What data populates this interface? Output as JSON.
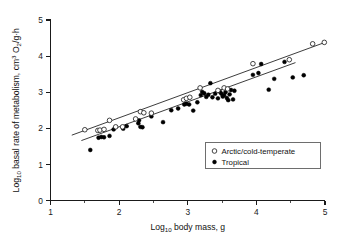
{
  "chart_data": {
    "type": "scatter",
    "title": "",
    "subtitle": "",
    "xlabel": "Log10 body mass, g",
    "ylabel": "Log10 basal rate of metabolism, cm3 O2/g·h",
    "xlabel_parts": {
      "prefix": "Log",
      "subscript": "10",
      "suffix": " body mass, g"
    },
    "ylabel_parts": {
      "prefix": "Log",
      "subscript": "10",
      "mid": " basal rate of metabolism, cm",
      "superscript": "3",
      "mid2": " O",
      "subscript2": "2",
      "suffix": "/g·h"
    },
    "xlim": [
      1,
      5
    ],
    "ylim": [
      0,
      5
    ],
    "xticks": [
      1,
      2,
      3,
      4,
      5
    ],
    "xtick_labels": [
      "1",
      "2",
      "3",
      "4",
      "5"
    ],
    "x_minor_ticks": [
      1.5,
      2.5,
      3.5,
      4.5
    ],
    "yticks": [
      0,
      1,
      2,
      3,
      4,
      5
    ],
    "ytick_labels": [
      "0",
      "1",
      "2",
      "3",
      "4",
      "5"
    ],
    "grid": false,
    "legend_position": "lower-right",
    "series": [
      {
        "name": "Arctic/cold-temperate",
        "marker": "open-circle",
        "color": "#000000",
        "points": [
          [
            1.5,
            1.96
          ],
          [
            1.69,
            1.94
          ],
          [
            1.72,
            1.95
          ],
          [
            1.78,
            1.97
          ],
          [
            1.86,
            2.22
          ],
          [
            1.95,
            2.04
          ],
          [
            2.05,
            2.04
          ],
          [
            2.24,
            2.26
          ],
          [
            2.31,
            2.46
          ],
          [
            2.36,
            2.43
          ],
          [
            2.47,
            2.42
          ],
          [
            2.94,
            2.79
          ],
          [
            2.98,
            2.83
          ],
          [
            3.03,
            2.86
          ],
          [
            3.18,
            3.12
          ],
          [
            3.44,
            3.05
          ],
          [
            3.53,
            3.12
          ],
          [
            3.58,
            3.09
          ],
          [
            3.95,
            3.79
          ],
          [
            4.48,
            3.9
          ],
          [
            4.82,
            4.34
          ],
          [
            4.99,
            4.38
          ]
        ]
      },
      {
        "name": "Tropical",
        "marker": "filled-circle",
        "color": "#000000",
        "points": [
          [
            1.58,
            1.4
          ],
          [
            1.7,
            1.74
          ],
          [
            1.74,
            1.76
          ],
          [
            1.78,
            1.75
          ],
          [
            1.86,
            1.79
          ],
          [
            1.92,
            1.97
          ],
          [
            2.06,
            1.99
          ],
          [
            2.11,
            2.06
          ],
          [
            2.28,
            2.14
          ],
          [
            2.29,
            2.22
          ],
          [
            2.31,
            2.04
          ],
          [
            2.34,
            2.03
          ],
          [
            2.47,
            2.33
          ],
          [
            2.64,
            2.17
          ],
          [
            2.76,
            2.5
          ],
          [
            2.86,
            2.55
          ],
          [
            2.95,
            2.66
          ],
          [
            2.98,
            2.68
          ],
          [
            3.02,
            2.66
          ],
          [
            3.08,
            2.49
          ],
          [
            3.14,
            2.72
          ],
          [
            3.19,
            2.92
          ],
          [
            3.21,
            3.01
          ],
          [
            3.24,
            2.97
          ],
          [
            3.27,
            2.87
          ],
          [
            3.3,
            2.93
          ],
          [
            3.33,
            3.25
          ],
          [
            3.36,
            2.86
          ],
          [
            3.4,
            2.96
          ],
          [
            3.44,
            2.83
          ],
          [
            3.47,
            3.01
          ],
          [
            3.49,
            2.96
          ],
          [
            3.51,
            2.88
          ],
          [
            3.53,
            2.92
          ],
          [
            3.55,
            3.0
          ],
          [
            3.57,
            2.84
          ],
          [
            3.59,
            2.78
          ],
          [
            3.61,
            2.94
          ],
          [
            3.63,
            3.06
          ],
          [
            3.66,
            2.8
          ],
          [
            3.68,
            3.04
          ],
          [
            3.95,
            3.48
          ],
          [
            4.03,
            3.53
          ],
          [
            4.07,
            3.78
          ],
          [
            4.18,
            3.07
          ],
          [
            4.26,
            3.37
          ],
          [
            4.41,
            3.84
          ],
          [
            4.53,
            3.41
          ],
          [
            4.69,
            3.47
          ]
        ]
      }
    ],
    "fit_lines": [
      {
        "name": "Arctic/cold-temperate fit",
        "x_start": 1.31,
        "y_start": 1.81,
        "x_end": 5.0,
        "y_end": 4.38
      },
      {
        "name": "Tropical fit",
        "x_start": 1.45,
        "y_start": 1.66,
        "x_end": 4.57,
        "y_end": 3.82
      }
    ],
    "legend": [
      {
        "label": "Arctic/cold-temperate",
        "marker": "open-circle"
      },
      {
        "label": "Tropical",
        "marker": "filled-circle"
      }
    ]
  }
}
